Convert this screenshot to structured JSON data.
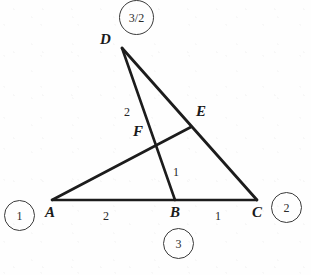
{
  "figure": {
    "type": "geometry-diagram",
    "background_color": "#fefefe",
    "stroke_color": "#1c1c1c",
    "vertices": [
      {
        "id": "A",
        "label": "A",
        "x": 52,
        "y": 200,
        "label_x": 45,
        "label_y": 205
      },
      {
        "id": "B",
        "label": "B",
        "x": 175,
        "y": 200,
        "label_x": 170,
        "label_y": 205
      },
      {
        "id": "C",
        "label": "C",
        "x": 257,
        "y": 200,
        "label_x": 252,
        "label_y": 205
      },
      {
        "id": "D",
        "label": "D",
        "x": 122,
        "y": 48,
        "label_x": 100,
        "label_y": 32
      },
      {
        "id": "E",
        "label": "E",
        "x": 190,
        "y": 128,
        "label_x": 196,
        "label_y": 104
      },
      {
        "id": "F",
        "label": "F",
        "x": 158,
        "y": 142,
        "label_x": 133,
        "label_y": 124
      }
    ],
    "segments": [
      {
        "id": "AC",
        "from": "A",
        "to": "C"
      },
      {
        "id": "DB",
        "from": "D",
        "to": "B"
      },
      {
        "id": "DC",
        "from": "D",
        "to": "C"
      },
      {
        "id": "AE",
        "from": "A",
        "to": "E"
      }
    ],
    "segment_labels": [
      {
        "id": "DF-length",
        "text": "2",
        "x": 124,
        "y": 106,
        "for": "DF"
      },
      {
        "id": "FB-length",
        "text": "1",
        "x": 173,
        "y": 166,
        "for": "FB"
      },
      {
        "id": "AB-length",
        "text": "2",
        "x": 103,
        "y": 210,
        "for": "AB"
      },
      {
        "id": "BC-length",
        "text": "1",
        "x": 215,
        "y": 210,
        "for": "BC"
      }
    ],
    "circled_notes": [
      {
        "id": "note-top",
        "text": "3/2",
        "cx": 136,
        "cy": 17,
        "d": 33
      },
      {
        "id": "note-left",
        "text": "1",
        "cx": 19,
        "cy": 215,
        "d": 29
      },
      {
        "id": "note-right",
        "text": "2",
        "cx": 286,
        "cy": 207,
        "d": 29
      },
      {
        "id": "note-bottom",
        "text": "3",
        "cx": 178,
        "cy": 243,
        "d": 29
      }
    ]
  }
}
